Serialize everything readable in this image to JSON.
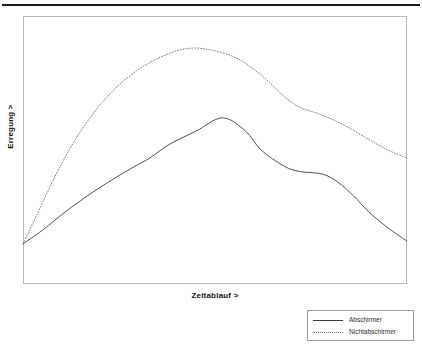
{
  "figure": {
    "ylabel": "Erregung >",
    "xlabel": "Zeitablauf >",
    "frame_color": "#b9b9b9",
    "rule_color": "#1a1a1a"
  },
  "legend": {
    "entries": [
      {
        "label": "Abschirmer",
        "style": "solid",
        "color": "#3a3a3a"
      },
      {
        "label": "Nichtabschirmer",
        "style": "dotted",
        "color": "#6a6a6a"
      }
    ]
  },
  "chart_data": {
    "type": "line",
    "title": "",
    "xlabel": "Zeitablauf >",
    "ylabel": "Erregung >",
    "xlim": [
      0,
      100
    ],
    "ylim": [
      0,
      100
    ],
    "grid": false,
    "legend_position": "bottom-right-outside",
    "axis_ticks": {
      "x": [],
      "y": []
    },
    "note": "Qualitative schematic curves; values are normalized 0-100 read off the plot frame.",
    "series": [
      {
        "name": "Abschirmer",
        "style": "solid",
        "color": "#3a3a3a",
        "x": [
          0,
          5,
          12,
          20,
          28,
          33,
          38,
          45,
          52,
          58,
          62,
          68,
          72,
          78,
          82,
          86,
          90,
          95,
          100
        ],
        "y": [
          15,
          20,
          28,
          36,
          43,
          47,
          52,
          57,
          62,
          57,
          50,
          44,
          42,
          41,
          38,
          33,
          27,
          21,
          16
        ]
      },
      {
        "name": "Nichtabschirmer",
        "style": "dotted",
        "color": "#6a6a6a",
        "x": [
          0,
          4,
          9,
          15,
          22,
          30,
          38,
          44,
          50,
          56,
          62,
          68,
          72,
          78,
          84,
          90,
          95,
          100
        ],
        "y": [
          15,
          27,
          42,
          57,
          70,
          80,
          86,
          88,
          87,
          84,
          78,
          70,
          66,
          63,
          59,
          54,
          50,
          47
        ]
      }
    ]
  }
}
